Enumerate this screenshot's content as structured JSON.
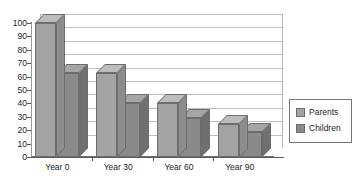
{
  "chart_data": {
    "type": "bar",
    "title": "",
    "subtitle": "",
    "xlabel": "",
    "ylabel": "",
    "categories": [
      "Year 0",
      "Year 30",
      "Year 60",
      "Year 90"
    ],
    "series": [
      {
        "name": "Parents",
        "values": [
          100,
          63,
          40,
          25
        ],
        "color": "#a3a3a3"
      },
      {
        "name": "Children",
        "values": [
          63,
          40,
          29,
          19
        ],
        "color": "#8a8a8a"
      }
    ],
    "ylim": [
      0,
      100
    ],
    "y_ticks": [
      0,
      10,
      20,
      30,
      40,
      50,
      60,
      70,
      80,
      90,
      100
    ],
    "y_tick_labels": [
      "0",
      "10",
      "20",
      "30",
      "40",
      "50",
      "60",
      "70",
      "80",
      "90",
      "100"
    ],
    "grid": true,
    "grid_axis": "y",
    "legend_position": "right",
    "three_d": true,
    "annotations": []
  },
  "legend": {
    "entries": [
      {
        "label": "Parents"
      },
      {
        "label": "Children"
      }
    ]
  }
}
